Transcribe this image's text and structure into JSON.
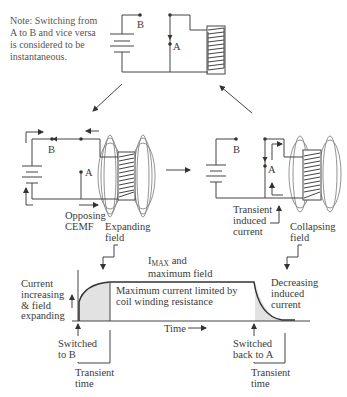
{
  "note": {
    "lines": [
      "Note: Switching from",
      "A to B and vice versa",
      "is considered to be",
      "instantaneous."
    ]
  },
  "top_circuit": {
    "switch_b_label": "B",
    "switch_a_label": "A"
  },
  "left_circuit": {
    "switch_b_label": "B",
    "switch_a_label": "A",
    "cemf_label": [
      "Opposing",
      "CEMF"
    ],
    "field_label": [
      "Expanding",
      "field"
    ]
  },
  "right_circuit": {
    "switch_b_label": "B",
    "switch_a_label": "A",
    "induced_label": [
      "Transient",
      "induced",
      "current"
    ],
    "field_label": [
      "Collapsing",
      "field"
    ]
  },
  "graph": {
    "imax_main": "I",
    "imax_sub": "MAX",
    "imax_rest": " and",
    "imax_line2": "maximum field",
    "left_label": [
      "Current",
      "increasing",
      "& field",
      "expanding"
    ],
    "middle_label": [
      "Maximum current limited by",
      "coil winding resistance"
    ],
    "right_label": [
      "Decreasing",
      "induced",
      "current"
    ],
    "time_label": "Time",
    "switched_b": [
      "Switched",
      "to B"
    ],
    "switched_a": [
      "Switched",
      "back to A"
    ],
    "transient_left": [
      "Transient",
      "time"
    ],
    "transient_right": [
      "Transient",
      "time"
    ]
  },
  "colors": {
    "line": "#444444",
    "text": "#3a3a3a",
    "shade": "#e2e2e2",
    "background": "#ffffff"
  }
}
